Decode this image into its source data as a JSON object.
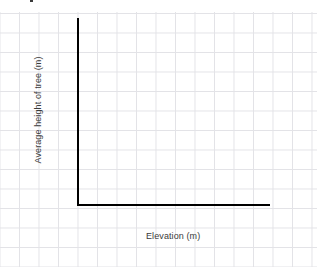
{
  "chart_data": {
    "type": "line",
    "title": "",
    "subtitle": "",
    "xlabel": "Elevation (m)",
    "ylabel": "Average height of tree (m)",
    "categories": [],
    "values": [],
    "series": [],
    "annotations": [],
    "legend": {
      "entries": [],
      "position": "none"
    },
    "grid": true,
    "grid_style": "graph-paper squares",
    "xtick_labels": [],
    "ytick_labels": [],
    "xlim": null,
    "ylim": null,
    "note": "Empty axes template drawn on graph paper: black vertical y-axis and horizontal x-axis forming an L, no plotted data points, no tick labels."
  },
  "canvas": {
    "background_color": "#ffffff",
    "grid_color": "#e3e3e7",
    "grid_spacing_px": 19.5
  },
  "axes": {
    "line_color": "#000000",
    "y_axis_name": "y-axis-line",
    "x_axis_name": "x-axis-line"
  },
  "labels": {
    "x_axis_title": "Elevation (m)",
    "y_axis_title": "Average height of tree (m)",
    "text_color": "#3b3b3b"
  },
  "artifacts": {
    "top_edge_fragment": ""
  }
}
